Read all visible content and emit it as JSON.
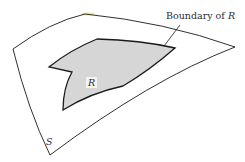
{
  "figure": {
    "labels": {
      "boundary_prefix": "Boundary of ",
      "boundary_var": "R",
      "region": "R",
      "surface": "S"
    },
    "colors": {
      "stroke": "#1a1a1a",
      "region_fill": "#d6d6d6",
      "background": "#ffffff",
      "highlight": "#f3e27a"
    }
  }
}
